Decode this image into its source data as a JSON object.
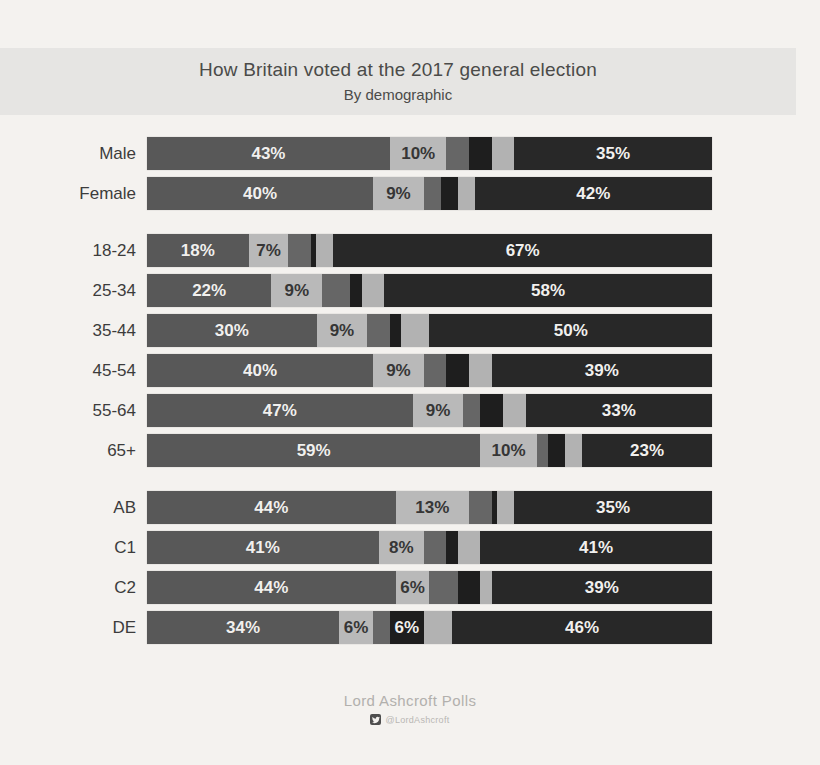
{
  "header": {
    "title": "How Britain voted at the 2017 general election",
    "subtitle": "By demographic"
  },
  "footer": {
    "source": "Lord Ashcroft Polls",
    "twitter_handle": "@LordAshcroft",
    "twitter_icon": "twitter-bird-icon"
  },
  "colors": {
    "page_bg": "#f4f2ef",
    "header_band_bg": "#e6e5e3",
    "title_text": "#4b4b49",
    "row_label_text": "#3c3c3c",
    "segment_label_light": "#f1f0ee",
    "segment_label_dark": "#363636",
    "footer_text": "#b2b0ad",
    "segments": [
      "#585858",
      "#b9b9b9",
      "#666666",
      "#1e1e1e",
      "#b2b2b2",
      "#282828"
    ]
  },
  "chart_data": {
    "type": "bar",
    "orientation": "horizontal-stacked",
    "title": "How Britain voted at the 2017 general election",
    "subtitle": "By demographic",
    "value_unit": "%",
    "xlim": [
      0,
      100
    ],
    "axis": "none",
    "legend": "none",
    "segment_shades": [
      "dark-gray",
      "light-gray",
      "medium-gray",
      "near-black",
      "light-gray",
      "darkest-gray"
    ],
    "groups": [
      {
        "id": "gender",
        "rows": [
          {
            "label": "Male",
            "values": [
              43,
              10,
              4,
              4,
              4,
              35
            ],
            "segment_labels": [
              "43%",
              "10%",
              "",
              "",
              "",
              "35%"
            ]
          },
          {
            "label": "Female",
            "values": [
              40,
              9,
              3,
              3,
              3,
              42
            ],
            "segment_labels": [
              "40%",
              "9%",
              "",
              "",
              "",
              "42%"
            ]
          }
        ]
      },
      {
        "id": "age",
        "rows": [
          {
            "label": "18-24",
            "values": [
              18,
              7,
              4,
              1,
              3,
              67
            ],
            "segment_labels": [
              "18%",
              "7%",
              "",
              "",
              "",
              "67%"
            ]
          },
          {
            "label": "25-34",
            "values": [
              22,
              9,
              5,
              2,
              4,
              58
            ],
            "segment_labels": [
              "22%",
              "9%",
              "",
              "",
              "",
              "58%"
            ]
          },
          {
            "label": "35-44",
            "values": [
              30,
              9,
              4,
              2,
              5,
              50
            ],
            "segment_labels": [
              "30%",
              "9%",
              "",
              "",
              "",
              "50%"
            ]
          },
          {
            "label": "45-54",
            "values": [
              40,
              9,
              4,
              4,
              4,
              39
            ],
            "segment_labels": [
              "40%",
              "9%",
              "",
              "",
              "",
              "39%"
            ]
          },
          {
            "label": "55-64",
            "values": [
              47,
              9,
              3,
              4,
              4,
              33
            ],
            "segment_labels": [
              "47%",
              "9%",
              "",
              "",
              "",
              "33%"
            ]
          },
          {
            "label": "65+",
            "values": [
              59,
              10,
              2,
              3,
              3,
              23
            ],
            "segment_labels": [
              "59%",
              "10%",
              "",
              "",
              "",
              "23%"
            ]
          }
        ]
      },
      {
        "id": "social-grade",
        "rows": [
          {
            "label": "AB",
            "values": [
              44,
              13,
              4,
              1,
              3,
              35
            ],
            "segment_labels": [
              "44%",
              "13%",
              "",
              "",
              "",
              "35%"
            ]
          },
          {
            "label": "C1",
            "values": [
              41,
              8,
              4,
              2,
              4,
              41
            ],
            "segment_labels": [
              "41%",
              "8%",
              "",
              "",
              "",
              "41%"
            ]
          },
          {
            "label": "C2",
            "values": [
              44,
              6,
              5,
              4,
              2,
              39
            ],
            "segment_labels": [
              "44%",
              "6%",
              "",
              "",
              "",
              "39%"
            ]
          },
          {
            "label": "DE",
            "values": [
              34,
              6,
              3,
              6,
              5,
              46
            ],
            "segment_labels": [
              "34%",
              "6%",
              "",
              "6%",
              "",
              "46%"
            ]
          }
        ]
      }
    ]
  }
}
